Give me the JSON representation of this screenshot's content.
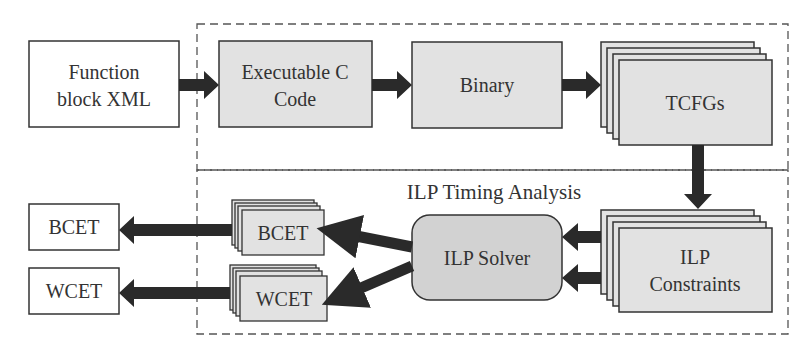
{
  "diagram": {
    "colors": {
      "box_fill_gray": "#e2e2e2",
      "solver_fill": "#d2d2d2",
      "box_fill_white": "#ffffff",
      "stroke": "#333333",
      "arrow": "#2a2a2a",
      "dashed": "#555555"
    },
    "groups": {
      "top": {
        "label": ""
      },
      "bottom": {
        "label": "ILP Timing Analysis"
      }
    },
    "nodes": {
      "function_block": {
        "line1": "Function",
        "line2": "block XML"
      },
      "exec_c": {
        "line1": "Executable C",
        "line2": "Code"
      },
      "binary": {
        "label": "Binary"
      },
      "tcfgs": {
        "label": "TCFGs"
      },
      "ilp_constraints": {
        "line1": "ILP",
        "line2": "Constraints"
      },
      "ilp_solver": {
        "label": "ILP Solver"
      },
      "bcet_stack": {
        "label": "BCET"
      },
      "wcet_stack": {
        "label": "WCET"
      },
      "bcet_out": {
        "label": "BCET"
      },
      "wcet_out": {
        "label": "WCET"
      }
    },
    "edges": [
      {
        "from": "Function block XML",
        "to": "Executable C Code"
      },
      {
        "from": "Executable C Code",
        "to": "Binary"
      },
      {
        "from": "Binary",
        "to": "TCFGs"
      },
      {
        "from": "TCFGs",
        "to": "ILP Constraints"
      },
      {
        "from": "ILP Constraints",
        "to": "ILP Solver"
      },
      {
        "from": "ILP Constraints",
        "to": "ILP Solver"
      },
      {
        "from": "ILP Solver",
        "to": "BCET (stack)"
      },
      {
        "from": "ILP Solver",
        "to": "WCET (stack)"
      },
      {
        "from": "BCET (stack)",
        "to": "BCET"
      },
      {
        "from": "WCET (stack)",
        "to": "WCET"
      }
    ]
  }
}
